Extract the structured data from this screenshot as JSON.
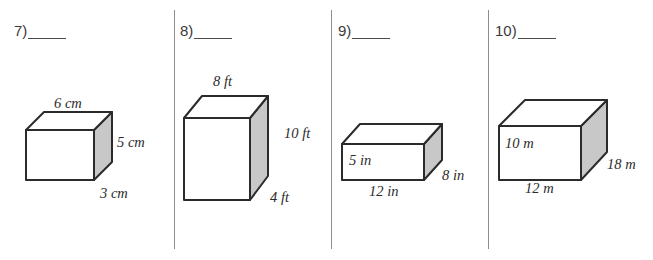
{
  "page": {
    "background_color": "#ffffff",
    "divider_color": "#8e8e8e",
    "ink_color": "#2b2b2b",
    "shade_color": "#c8c8c8",
    "face_color": "#ffffff"
  },
  "problems": [
    {
      "number": "7)",
      "blank": "",
      "shape": "rectangular-prism",
      "units": "cm",
      "dims": {
        "top": "6 cm",
        "right": "5 cm",
        "depth": "3 cm"
      },
      "labels": {
        "top": "6 cm",
        "height": "5 cm",
        "front_bottom": "3 cm"
      }
    },
    {
      "number": "8)",
      "blank": "",
      "shape": "rectangular-prism",
      "units": "ft",
      "dims": {
        "top": "8 ft",
        "right": "10 ft",
        "depth": "4 ft"
      },
      "labels": {
        "top": "8 ft",
        "height": "10 ft",
        "front_bottom": "4 ft"
      }
    },
    {
      "number": "9)",
      "blank": "",
      "shape": "rectangular-prism",
      "units": "in",
      "dims": {
        "height": "5 in",
        "width": "12 in",
        "depth": "8 in"
      },
      "labels": {
        "left_inside": "5 in",
        "bottom": "12 in",
        "right": "8 in"
      }
    },
    {
      "number": "10)",
      "blank": "",
      "shape": "rectangular-prism",
      "units": "m",
      "dims": {
        "height": "10 m",
        "width": "12 m",
        "depth": "18 m"
      },
      "labels": {
        "left_inside": "10 m",
        "bottom": "12 m",
        "right": "18 m"
      }
    }
  ]
}
